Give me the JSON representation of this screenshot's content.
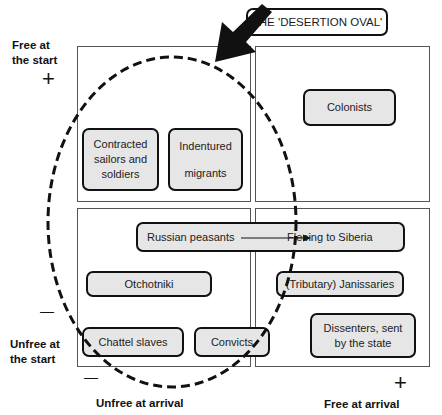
{
  "title": "THE 'DESERTION OVAL'",
  "axes": {
    "y_top_label": "Free at the start",
    "y_top_label_lines": [
      "Free at",
      "the start"
    ],
    "y_bottom_label_lines": [
      "Unfree at",
      "the start"
    ],
    "y_plus": "+",
    "y_minus": "—",
    "x_left_label": "Unfree at arrival",
    "x_right_label": "Free at arrival",
    "x_minus": "—",
    "x_plus": "+"
  },
  "quadrants": {
    "top_left": {
      "boxes": [
        {
          "lines": [
            "Contracted",
            "sailors and",
            "soldiers"
          ]
        },
        {
          "lines": [
            "Indentured",
            "migrants"
          ]
        }
      ]
    },
    "top_right": {
      "boxes": [
        {
          "lines": [
            "Colonists"
          ]
        }
      ]
    },
    "bottom_left": {
      "boxes": [
        {
          "lines": [
            "Otchotniki"
          ]
        },
        {
          "lines": [
            "Chattel slaves"
          ]
        },
        {
          "lines": [
            "Convicts"
          ]
        }
      ]
    },
    "bottom_right": {
      "boxes": [
        {
          "lines": [
            "(Tributary) Janissaries"
          ]
        },
        {
          "lines": [
            "Dissenters, sent",
            "by the state"
          ]
        }
      ]
    }
  },
  "spanning_box": {
    "from": "Russian peasants",
    "to": "Fleeing to Siberia"
  },
  "colors": {
    "box_fill": "#e6e6e6",
    "border": "#111111",
    "quad_border": "#555555"
  }
}
